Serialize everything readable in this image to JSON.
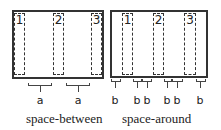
{
  "panels": [
    {
      "id": "space-between",
      "caption": "space-between",
      "items": [
        "1",
        "2",
        "3"
      ],
      "gap_label": "a",
      "gaps": [
        "a",
        "a"
      ]
    },
    {
      "id": "space-around",
      "caption": "space-around",
      "items": [
        "1",
        "2",
        "3"
      ],
      "gap_label": "b",
      "gaps": [
        "b",
        "b",
        "b",
        "b",
        "b",
        "b"
      ]
    }
  ],
  "colors": {
    "border": "#333333",
    "background": "#ffffff"
  }
}
